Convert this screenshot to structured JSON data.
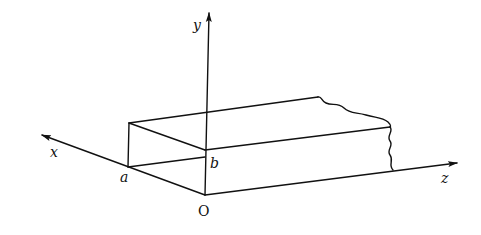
{
  "diagram": {
    "labels": {
      "x_axis": "x",
      "y_axis": "y",
      "z_axis": "z",
      "origin": "O",
      "width_a": "a",
      "height_b": "b"
    },
    "colors": {
      "stroke": "#111111",
      "background": "#ffffff"
    }
  }
}
